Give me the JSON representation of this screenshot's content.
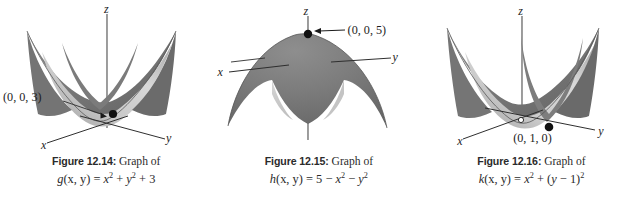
{
  "page": {
    "background": "#ffffff",
    "kind": "textbook-figure-row",
    "figure_count": 3
  },
  "figures": [
    {
      "id": "figure-12-14",
      "caption": {
        "number": "Figure 12.14:",
        "graph_of": "Graph of",
        "formula_plain": "g(x, y) = x² + y² + 3",
        "fn_name": "g",
        "args": "(x, y)",
        "equals": "=",
        "terms": [
          {
            "base": "x",
            "exp": "2"
          },
          {
            "op": "+"
          },
          {
            "base": "y",
            "exp": "2"
          },
          {
            "op": "+"
          },
          {
            "num": "3"
          }
        ]
      },
      "surface": {
        "type": "paraboloid-up",
        "equation": "z = x^2 + y^2 + 3",
        "opens": "upward",
        "vertex_marked": true,
        "fill_dark": "#6d6d6d",
        "fill_light": "#d2d2d2",
        "edge": "#4a4a4a"
      },
      "axes": [
        {
          "name": "z",
          "label": "z",
          "direction": "up"
        },
        {
          "name": "x",
          "label": "x",
          "direction": "front-left"
        },
        {
          "name": "y",
          "label": "y",
          "direction": "front-right"
        }
      ],
      "annotations": [
        {
          "name": "vertex-point",
          "label": "(0, 0, 3)",
          "has_leader": true,
          "has_dot": true
        }
      ]
    },
    {
      "id": "figure-12-15",
      "caption": {
        "number": "Figure 12.15:",
        "graph_of": "Graph of",
        "formula_plain": "h(x, y) = 5 − x² − y²",
        "fn_name": "h",
        "args": "(x, y)",
        "equals": "=",
        "terms": [
          {
            "num": "5"
          },
          {
            "op": "−"
          },
          {
            "base": "x",
            "exp": "2"
          },
          {
            "op": "−"
          },
          {
            "base": "y",
            "exp": "2"
          }
        ]
      },
      "surface": {
        "type": "paraboloid-down",
        "equation": "z = 5 - x^2 - y^2",
        "opens": "downward",
        "vertex_marked": true,
        "fill_dark": "#6d6d6d",
        "fill_light": "#d2d2d2",
        "edge": "#4a4a4a"
      },
      "axes": [
        {
          "name": "z",
          "label": "z",
          "direction": "up"
        },
        {
          "name": "x",
          "label": "x",
          "direction": "left"
        },
        {
          "name": "y",
          "label": "y",
          "direction": "right"
        }
      ],
      "annotations": [
        {
          "name": "peak-point",
          "label": "(0, 0, 5)",
          "has_leader": true,
          "has_dot": true
        }
      ]
    },
    {
      "id": "figure-12-16",
      "caption": {
        "number": "Figure 12.16:",
        "graph_of": "Graph of",
        "formula_plain": "k(x, y) = x² + (y − 1)²",
        "fn_name": "k",
        "args": "(x, y)",
        "equals": "=",
        "terms": [
          {
            "base": "x",
            "exp": "2"
          },
          {
            "op": "+"
          },
          {
            "group": "(y − 1)",
            "exp": "2"
          }
        ]
      },
      "surface": {
        "type": "paraboloid-up",
        "equation": "z = x^2 + (y-1)^2",
        "opens": "upward",
        "vertex_marked": true,
        "fill_dark": "#6d6d6d",
        "fill_light": "#d2d2d2",
        "edge": "#4a4a4a"
      },
      "axes": [
        {
          "name": "z",
          "label": "z",
          "direction": "up"
        },
        {
          "name": "x",
          "label": "x",
          "direction": "front-left"
        },
        {
          "name": "y",
          "label": "y",
          "direction": "front-right"
        }
      ],
      "annotations": [
        {
          "name": "vertex-point",
          "label": "(0, 1, 0)",
          "has_leader": false,
          "has_dot": true
        }
      ]
    }
  ]
}
